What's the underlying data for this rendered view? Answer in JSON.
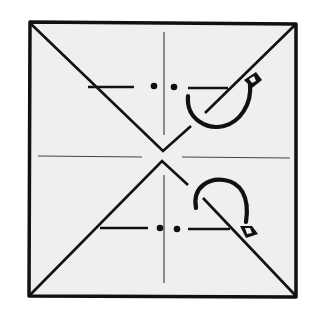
{
  "diagram": {
    "type": "origami-fold-diagram",
    "colors": {
      "paper": "#efefef",
      "ink": "#111111",
      "crease": "#444444",
      "background": "#ffffff"
    },
    "square": {
      "x1": 29,
      "y1": 21,
      "x2": 297,
      "y2": 297
    },
    "center": {
      "x": 162,
      "y": 155
    },
    "icons": [
      "fold-arrow-icon",
      "fold-arrow-icon"
    ]
  }
}
